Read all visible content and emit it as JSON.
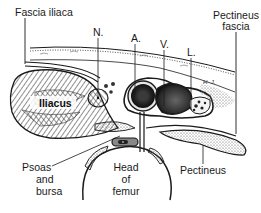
{
  "diagram": {
    "type": "anatomical-cross-section",
    "colors": {
      "ink": "#1a1a1a",
      "background": "#ffffff",
      "vessel_fill": "#2a2a2a",
      "hatch": "#555555"
    },
    "labels": {
      "fascia_iliaca": "Fascia iliaca",
      "nerve": "N.",
      "artery": "A.",
      "vein": "V.",
      "lymphatic": "L.",
      "pectineus_fascia_1": "Pectineus",
      "pectineus_fascia_2": "fascia",
      "iliacus": "Iliacus",
      "psoas_1": "Psoas",
      "psoas_2": "and",
      "psoas_3": "bursa",
      "head_1": "Head",
      "head_2": "of",
      "head_3": "femur",
      "pectineus": "Pectineus",
      "signature": "H. J."
    }
  }
}
